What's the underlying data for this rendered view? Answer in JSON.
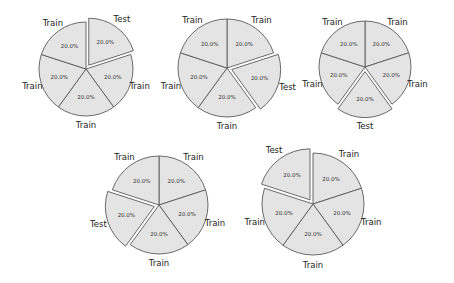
{
  "chart_data": [
    {
      "type": "pie",
      "title": "",
      "fold": 1,
      "center": [
        86,
        69
      ],
      "radius": 47,
      "labels": [
        "Test",
        "Train",
        "Train",
        "Train",
        "Train"
      ],
      "values": [
        20.0,
        20.0,
        20.0,
        20.0,
        20.0
      ],
      "autopct": [
        "20.0%",
        "20.0%",
        "20.0%",
        "20.0%",
        "20.0%"
      ],
      "explode": [
        0.1,
        0,
        0,
        0,
        0
      ],
      "startangle": 90,
      "counterclock": false
    },
    {
      "type": "pie",
      "title": "",
      "fold": 2,
      "center": [
        227,
        68
      ],
      "radius": 49,
      "labels": [
        "Train",
        "Test",
        "Train",
        "Train",
        "Train"
      ],
      "values": [
        20.0,
        20.0,
        20.0,
        20.0,
        20.0
      ],
      "autopct": [
        "20.0%",
        "20.0%",
        "20.0%",
        "20.0%",
        "20.0%"
      ],
      "explode": [
        0,
        0.1,
        0,
        0,
        0
      ],
      "startangle": 90,
      "counterclock": false
    },
    {
      "type": "pie",
      "title": "",
      "fold": 3,
      "center": [
        365,
        67
      ],
      "radius": 46,
      "labels": [
        "Train",
        "Train",
        "Test",
        "Train",
        "Train"
      ],
      "values": [
        20.0,
        20.0,
        20.0,
        20.0,
        20.0
      ],
      "autopct": [
        "20.0%",
        "20.0%",
        "20.0%",
        "20.0%",
        "20.0%"
      ],
      "explode": [
        0,
        0,
        0.1,
        0,
        0
      ],
      "startangle": 90,
      "counterclock": false
    },
    {
      "type": "pie",
      "title": "",
      "fold": 4,
      "center": [
        159,
        205
      ],
      "radius": 49,
      "labels": [
        "Train",
        "Train",
        "Train",
        "Test",
        "Train"
      ],
      "values": [
        20.0,
        20.0,
        20.0,
        20.0,
        20.0
      ],
      "autopct": [
        "20.0%",
        "20.0%",
        "20.0%",
        "20.0%",
        "20.0%"
      ],
      "explode": [
        0,
        0,
        0,
        0.1,
        0
      ],
      "startangle": 90,
      "counterclock": false
    },
    {
      "type": "pie",
      "title": "",
      "fold": 5,
      "center": [
        313,
        204
      ],
      "radius": 51,
      "labels": [
        "Train",
        "Train",
        "Train",
        "Train",
        "Test"
      ],
      "values": [
        20.0,
        20.0,
        20.0,
        20.0,
        20.0
      ],
      "autopct": [
        "20.0%",
        "20.0%",
        "20.0%",
        "20.0%",
        "20.0%"
      ],
      "explode": [
        0,
        0,
        0,
        0,
        0.1
      ],
      "startangle": 90,
      "counterclock": false
    }
  ],
  "colors": {
    "slice_fill": "#e4e4e4",
    "slice_edge": "#5a5a5a",
    "text": "#222222"
  }
}
